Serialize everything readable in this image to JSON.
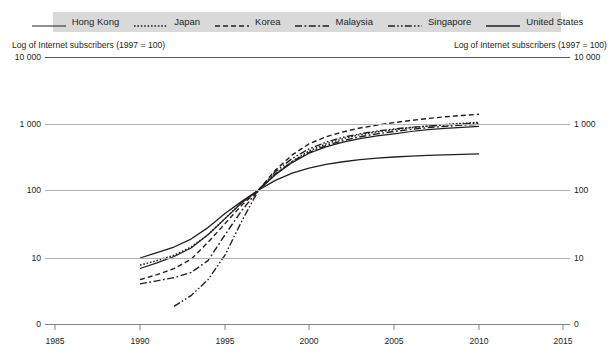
{
  "legend": {
    "items": [
      {
        "label": "Hong Kong",
        "style": "solid",
        "name": "legend-item-hong-kong"
      },
      {
        "label": "Japan",
        "style": "dotted",
        "name": "legend-item-japan"
      },
      {
        "label": "Korea",
        "style": "dashed",
        "name": "legend-item-korea"
      },
      {
        "label": "Malaysia",
        "style": "dash-dot",
        "name": "legend-item-malaysia"
      },
      {
        "label": "Singapore",
        "style": "dash-dot-dot",
        "name": "legend-item-singapore"
      },
      {
        "label": "United States",
        "style": "solid-thick",
        "name": "legend-item-united-states"
      }
    ],
    "background_color": "#d9d9d9"
  },
  "axis_titles": {
    "left": "Log of Internet subscribers (1997 = 100)",
    "right": "Log of Internet subscribers (1997 = 100)"
  },
  "y_ticks_left": [
    "10 000",
    "1 000",
    "100",
    "10",
    "0"
  ],
  "y_ticks_right": [
    "10 000",
    "1 000",
    "100",
    "10",
    "0"
  ],
  "x_ticks": [
    "1985",
    "1990",
    "1995",
    "2000",
    "2005",
    "2010",
    "2015"
  ],
  "colors": {
    "line": "#231f20",
    "grid": "#b3b3b3",
    "axis": "#808285",
    "legend_bg": "#d9d9d9",
    "text": "#231f20"
  },
  "chart_data": {
    "type": "line",
    "title": "Log of Internet subscribers (1997 = 100)",
    "xlabel": "",
    "ylabel": "Log of Internet subscribers (1997 = 100)",
    "y_scale": "log",
    "y_tick_values": [
      10000,
      1000,
      100,
      10,
      0
    ],
    "ylim": [
      0,
      10000
    ],
    "xlim": [
      1985,
      2015
    ],
    "x_tick_values": [
      1985,
      1990,
      1995,
      2000,
      2005,
      2010,
      2015
    ],
    "grid": true,
    "legend_position": "top",
    "normalization_note": "1997 = 100",
    "series": [
      {
        "name": "Hong Kong",
        "style": "solid",
        "x": [
          1990,
          1991,
          1992,
          1993,
          1994,
          1995,
          1996,
          1997,
          1998,
          1999,
          2000,
          2001,
          2002,
          2003,
          2004,
          2005,
          2006,
          2007,
          2008,
          2009,
          2010
        ],
        "y": [
          6.5,
          8.2,
          10.5,
          14.0,
          22.0,
          38.0,
          65.0,
          100,
          170,
          260,
          360,
          450,
          530,
          600,
          660,
          710,
          770,
          820,
          860,
          890,
          920
        ]
      },
      {
        "name": "Japan",
        "style": "dotted",
        "x": [
          1990,
          1991,
          1992,
          1993,
          1994,
          1995,
          1996,
          1997,
          1998,
          1999,
          2000,
          2001,
          2002,
          2003,
          2004,
          2005,
          2006,
          2007,
          2008,
          2009,
          2010
        ],
        "y": [
          7.5,
          9.0,
          11.0,
          14.5,
          22.0,
          38.0,
          66.0,
          100,
          175,
          270,
          390,
          500,
          600,
          690,
          760,
          820,
          880,
          930,
          980,
          1020,
          1060
        ]
      },
      {
        "name": "Korea",
        "style": "dashed",
        "x": [
          1990,
          1991,
          1992,
          1993,
          1994,
          1995,
          1996,
          1997,
          1998,
          1999,
          2000,
          2001,
          2002,
          2003,
          2004,
          2005,
          2006,
          2007,
          2008,
          2009,
          2010
        ],
        "y": [
          4.0,
          5.0,
          6.5,
          9.5,
          17.0,
          32.0,
          60.0,
          100,
          200,
          340,
          500,
          640,
          760,
          870,
          960,
          1050,
          1130,
          1210,
          1280,
          1340,
          1400
        ]
      },
      {
        "name": "Malaysia",
        "style": "dash-dot",
        "x": [
          1990,
          1991,
          1992,
          1993,
          1994,
          1995,
          1996,
          1997,
          1998,
          1999,
          2000,
          2001,
          2002,
          2003,
          2004,
          2005,
          2006,
          2007,
          2008,
          2009,
          2010
        ],
        "y": [
          3.3,
          3.8,
          4.4,
          5.5,
          9.0,
          22.0,
          50.0,
          100,
          175,
          270,
          370,
          470,
          560,
          640,
          710,
          770,
          830,
          880,
          920,
          960,
          990
        ]
      },
      {
        "name": "Singapore",
        "style": "dash-dot-dot",
        "x": [
          1992,
          1993,
          1994,
          1995,
          1996,
          1997,
          1998,
          1999,
          2000,
          2001,
          2002,
          2003,
          2004,
          2005,
          2006,
          2007,
          2008,
          2009,
          2010
        ],
        "y": [
          0.9,
          1.8,
          4.0,
          11.0,
          35.0,
          100,
          190,
          300,
          420,
          530,
          630,
          710,
          780,
          840,
          890,
          930,
          970,
          1000,
          1030
        ]
      },
      {
        "name": "United States",
        "style": "solid-thick",
        "x": [
          1990,
          1991,
          1992,
          1993,
          1994,
          1995,
          1996,
          1997,
          1998,
          1999,
          2000,
          2001,
          2002,
          2003,
          2004,
          2005,
          2006,
          2007,
          2008,
          2009,
          2010
        ],
        "y": [
          10.0,
          12.0,
          14.5,
          19.0,
          28.0,
          45.0,
          68.0,
          100,
          140,
          180,
          215,
          245,
          268,
          288,
          303,
          316,
          326,
          334,
          341,
          347,
          352
        ]
      }
    ]
  }
}
